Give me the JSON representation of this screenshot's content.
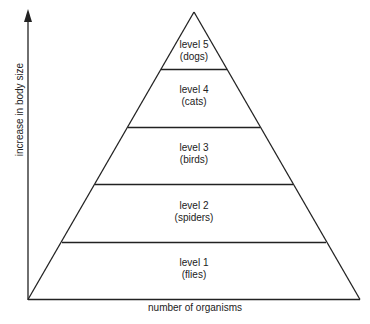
{
  "diagram": {
    "type": "pyramid",
    "y_axis_label": "increase in body size",
    "x_axis_label": "number of organisms",
    "levels": [
      {
        "level": "level 5",
        "organism": "(dogs)"
      },
      {
        "level": "level 4",
        "organism": "(cats)"
      },
      {
        "level": "level 3",
        "organism": "(birds)"
      },
      {
        "level": "level 2",
        "organism": "(spiders)"
      },
      {
        "level": "level 1",
        "organism": "(flies)"
      }
    ]
  }
}
